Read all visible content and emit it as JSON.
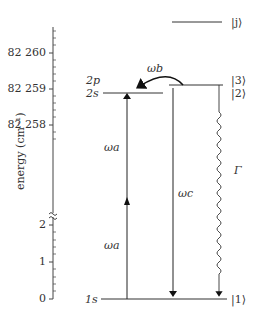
{
  "diagram": {
    "type": "energy-level-diagram",
    "axis": {
      "label": "energy (cm⁻¹)",
      "upper_ticks": [
        "82 260",
        "82 259",
        "82 258"
      ],
      "lower_ticks": [
        "2",
        "1",
        "0"
      ],
      "break": true
    },
    "levels": {
      "j": "|j⟩",
      "three": "|3⟩",
      "two": "|2⟩",
      "one": "|1⟩",
      "two_p": "2p",
      "two_s": "2s",
      "one_s": "1s"
    },
    "transitions": {
      "omega_a_upper": "ωa",
      "omega_a_lower": "ωa",
      "omega_b": "ωb",
      "omega_c": "ωc",
      "gamma": "Γ"
    }
  }
}
